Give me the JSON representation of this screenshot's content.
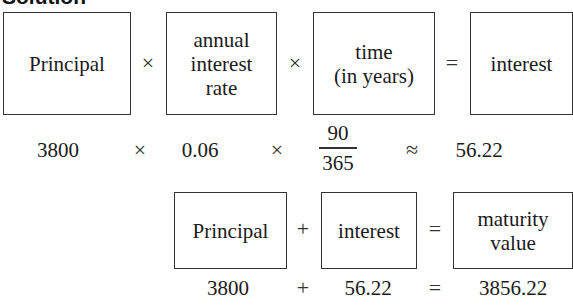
{
  "heading": "Solution",
  "interest_formula": {
    "boxes": [
      "Principal",
      "annual\ninterest\nrate",
      "time\n(in years)",
      "interest"
    ],
    "operators": [
      "×",
      "×",
      "="
    ],
    "values": {
      "principal": "3800",
      "op1": "×",
      "rate": "0.06",
      "op2": "×",
      "time_numerator": "90",
      "time_denominator": "365",
      "op3": "≈",
      "interest": "56.22"
    }
  },
  "maturity_formula": {
    "boxes": [
      "Principal",
      "interest",
      "maturity\nvalue"
    ],
    "operators": [
      "+",
      "="
    ],
    "values": {
      "principal": "3800",
      "op1": "+",
      "interest": "56.22",
      "op2": "=",
      "maturity_value": "3856.22"
    }
  }
}
